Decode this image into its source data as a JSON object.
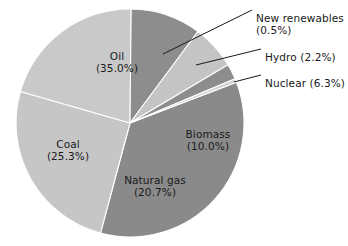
{
  "chart_data": {
    "type": "pie",
    "title": "",
    "subtitle": "",
    "xlabel": "",
    "ylabel": "",
    "legend_position": "none",
    "units": "percent",
    "total": 100.0,
    "categories": [
      "Oil",
      "Coal",
      "Natural gas",
      "Biomass",
      "Nuclear",
      "Hydro",
      "New renewables"
    ],
    "values": [
      35.0,
      25.3,
      20.7,
      10.0,
      6.3,
      2.2,
      0.5
    ],
    "slices": [
      {
        "name": "Oil",
        "label": "Oil",
        "percent": 35.0,
        "percent_text": "(35.0%)",
        "color": "#8a8a8a",
        "label_placement": "inside",
        "label_x": 117,
        "label_y": 62
      },
      {
        "name": "Coal",
        "label": "Coal",
        "percent": 25.3,
        "percent_text": "(25.3%)",
        "color": "#c6c6c6",
        "label_placement": "inside",
        "label_x": 68,
        "label_y": 150
      },
      {
        "name": "Natural gas",
        "label": "Natural gas",
        "percent": 20.7,
        "percent_text": "(20.7%)",
        "color": "#c9c9c9",
        "label_placement": "inside",
        "label_x": 155,
        "label_y": 186
      },
      {
        "name": "Biomass",
        "label": "Biomass",
        "percent": 10.0,
        "percent_text": "(10.0%)",
        "color": "#8d8d8d",
        "label_placement": "inside",
        "label_x": 208,
        "label_y": 140
      },
      {
        "name": "Nuclear",
        "label": "Nuclear (6.3%)",
        "percent": 6.3,
        "percent_text": "(6.3%)",
        "color": "#c4c4c4",
        "label_placement": "callout",
        "label_x": 265,
        "label_y": 77
      },
      {
        "name": "Hydro",
        "label": "Hydro (2.2%)",
        "percent": 2.2,
        "percent_text": "(2.2%)",
        "color": "#8d8d8d",
        "label_placement": "callout",
        "label_x": 265,
        "label_y": 51
      },
      {
        "name": "New renewables",
        "label": "New renewables",
        "percent": 0.5,
        "percent_text": "(0.5%)",
        "color": "#d2d2d2",
        "label_placement": "callout",
        "label_x": 256,
        "label_y": 12
      }
    ],
    "geometry": {
      "center_x": 130,
      "center_y": 123,
      "radius": 114,
      "start_angle_deg": -21.0,
      "direction": "clockwise"
    },
    "style": {
      "background": "#ffffff",
      "text_color": "#1a1a1a",
      "slice_border": "#ffffff",
      "leader_line_color": "#1a1a1a"
    },
    "callout_lines": [
      {
        "name": "new-renewables-leader",
        "x1": 163,
        "y1": 54,
        "x2": 252,
        "y2": 10
      },
      {
        "name": "hydro-leader",
        "x1": 196,
        "y1": 65,
        "x2": 261,
        "y2": 49
      },
      {
        "name": "nuclear-leader",
        "x1": 234,
        "y1": 82,
        "x2": 261,
        "y2": 75
      }
    ]
  }
}
